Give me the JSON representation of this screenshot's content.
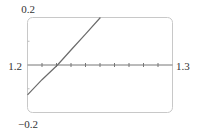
{
  "chart_data": {
    "type": "line",
    "title": "",
    "xlabel": "",
    "ylabel": "",
    "xlim": [
      1.2,
      1.3
    ],
    "ylim": [
      -0.2,
      0.2
    ],
    "x_ticks_step": 0.01,
    "y_ticks_step": 0.1,
    "grid": false,
    "labels": {
      "ymax": "0.2",
      "ymin": "−0.2",
      "xmin": "1.2",
      "xmax": "1.3"
    },
    "series": [
      {
        "name": "f(x)",
        "color": "#6b6b6b",
        "x": [
          1.2,
          1.21,
          1.2207,
          1.23,
          1.24,
          1.2503
        ],
        "y": [
          -0.126,
          -0.062,
          0.0,
          0.063,
          0.13,
          0.2
        ]
      }
    ]
  }
}
